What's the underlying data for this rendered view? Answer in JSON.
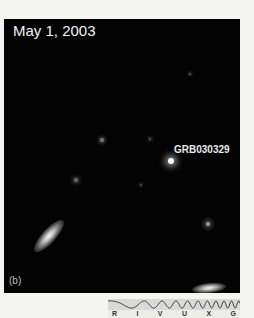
{
  "image": {
    "date_label": "May 1, 2003",
    "object_label": "GRB030329",
    "panel_label": "(b)",
    "background_color": "#030303"
  },
  "stars": [
    {
      "x": 186,
      "y": 55,
      "r": 1.2,
      "brightness": 0.35
    },
    {
      "x": 98,
      "y": 121,
      "r": 1.6,
      "brightness": 0.45
    },
    {
      "x": 146,
      "y": 120,
      "r": 1.4,
      "brightness": 0.35
    },
    {
      "x": 167,
      "y": 142,
      "r": 3.2,
      "brightness": 1.0
    },
    {
      "x": 72,
      "y": 161,
      "r": 1.6,
      "brightness": 0.4
    },
    {
      "x": 137,
      "y": 166,
      "r": 1.3,
      "brightness": 0.3
    },
    {
      "x": 204,
      "y": 205,
      "r": 2.2,
      "brightness": 0.6
    }
  ],
  "galaxies": [
    {
      "x": 45,
      "y": 217,
      "w": 42,
      "h": 14,
      "angle": -48
    },
    {
      "x": 205,
      "y": 269,
      "w": 34,
      "h": 10,
      "angle": -6
    }
  ],
  "spectrum_bar": {
    "bands": [
      "R",
      "I",
      "V",
      "U",
      "X",
      "G"
    ],
    "wave_color": "#3a3a3a"
  }
}
